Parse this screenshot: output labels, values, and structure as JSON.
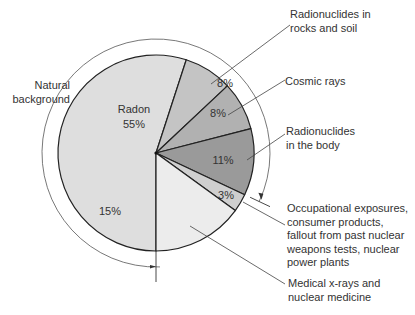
{
  "chart_data": {
    "type": "pie",
    "title": "",
    "start_angle_note": "slices proceed clockwise",
    "slices": [
      {
        "name": "Radon",
        "value": 55,
        "label": "55%",
        "inner_text": "Radon",
        "color": "#dedede"
      },
      {
        "name": "Radionuclides in rocks and soil",
        "value": 8,
        "label": "8%",
        "callout": [
          "Radionuclides in",
          "rocks and soil"
        ],
        "color": "#c4c4c4"
      },
      {
        "name": "Cosmic rays",
        "value": 8,
        "label": "8%",
        "callout": [
          "Cosmic rays"
        ],
        "color": "#b1b1b1"
      },
      {
        "name": "Radionuclides in the body",
        "value": 11,
        "label": "11%",
        "callout": [
          "Radionuclides",
          "in the body"
        ],
        "color": "#9a9a9a"
      },
      {
        "name": "Occupational exposures, consumer products, fallout from past nuclear weapons tests, nuclear power plants",
        "value": 3,
        "label": "3%",
        "callout": [
          "Occupational exposures,",
          "consumer products,",
          "fallout from past nuclear",
          "weapons tests, nuclear",
          "power plants"
        ],
        "color": "#cfcfcf"
      },
      {
        "name": "Medical x-rays and nuclear medicine",
        "value": 15,
        "label": "15%",
        "callout": [
          "Medical x-rays and",
          "nuclear medicine"
        ],
        "color": "#ececec"
      }
    ],
    "group_annotation": {
      "label": [
        "Natural",
        "background"
      ],
      "covers": [
        "Radon",
        "Radionuclides in rocks and soil",
        "Cosmic rays",
        "Radionuclides in the body"
      ],
      "total": 82
    }
  }
}
